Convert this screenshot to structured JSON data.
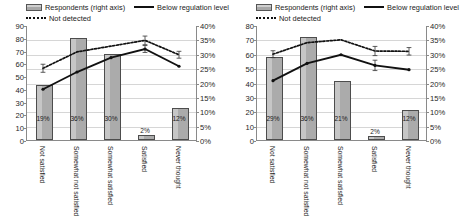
{
  "legend": {
    "bars_label": "Respondents (right axis)",
    "solid_label": "Below regulation level",
    "dotted_label": "Not detected"
  },
  "categories": [
    "Not satisfied",
    "Somewhat not satisfied",
    "Somewhat satisfied",
    "Satisfied",
    "Never thought"
  ],
  "chart_data": [
    {
      "type": "bar",
      "panel": "left",
      "title": "",
      "xlabel": "",
      "ylabel": "",
      "grid": true,
      "legend_position": "top",
      "categories": [
        "Not satisfied",
        "Somewhat not satisfied",
        "Somewhat satisfied",
        "Satisfied",
        "Never thought"
      ],
      "left_axis": {
        "ylim": [
          0,
          90
        ],
        "ticks": [
          "0",
          "10",
          "20",
          "30",
          "40",
          "50",
          "60",
          "70",
          "80",
          "90"
        ],
        "tick_values": [
          0,
          10,
          20,
          30,
          40,
          50,
          60,
          70,
          80,
          90
        ]
      },
      "right_axis": {
        "ylim": [
          0,
          40
        ],
        "ticks": [
          "0%",
          "5%",
          "10%",
          "15%",
          "20%",
          "25%",
          "30%",
          "35%",
          "40%"
        ],
        "tick_values": [
          0,
          5,
          10,
          15,
          20,
          25,
          30,
          35,
          40
        ]
      },
      "series": [
        {
          "name": "Respondents (right axis)",
          "kind": "bar",
          "axis": "left",
          "values": [
            43,
            80,
            67,
            4,
            25
          ],
          "data_labels": [
            "19%",
            "36%",
            "30%",
            "2%",
            "12%"
          ]
        },
        {
          "name": "Below regulation level",
          "kind": "line-solid",
          "axis": "right",
          "values": [
            18.0,
            24.0,
            29.0,
            32.0,
            26.0
          ],
          "errors": [
            0,
            0,
            0,
            1.2,
            0
          ]
        },
        {
          "name": "Not detected",
          "kind": "line-dotted",
          "axis": "right",
          "values": [
            25.3,
            31.0,
            33.0,
            35.0,
            30.0
          ],
          "errors": [
            1.4,
            0,
            0,
            1.5,
            1.2
          ]
        }
      ]
    },
    {
      "type": "bar",
      "panel": "right",
      "title": "",
      "xlabel": "",
      "ylabel": "",
      "grid": true,
      "legend_position": "top",
      "categories": [
        "Not satisfied",
        "Somewhat not satisfied",
        "Somewhat satisfied",
        "Satisfied",
        "Never thought"
      ],
      "left_axis": {
        "ylim": [
          0,
          80
        ],
        "ticks": [
          "0",
          "10",
          "20",
          "30",
          "40",
          "50",
          "60",
          "70",
          "80"
        ],
        "tick_values": [
          0,
          10,
          20,
          30,
          40,
          50,
          60,
          70,
          80
        ]
      },
      "right_axis": {
        "ylim": [
          0,
          40
        ],
        "ticks": [
          "0%",
          "5%",
          "10%",
          "15%",
          "20%",
          "25%",
          "30%",
          "35%",
          "40%"
        ],
        "tick_values": [
          0,
          5,
          10,
          15,
          20,
          25,
          30,
          35,
          40
        ]
      },
      "series": [
        {
          "name": "Respondents (right axis)",
          "kind": "bar",
          "axis": "left",
          "values": [
            58,
            72,
            41,
            3,
            21
          ],
          "data_labels": [
            "29%",
            "36%",
            "21%",
            "2%",
            "12%"
          ]
        },
        {
          "name": "Below regulation level",
          "kind": "line-solid",
          "axis": "right",
          "values": [
            21.0,
            27.0,
            30.0,
            26.3,
            24.8
          ],
          "errors": [
            0,
            0,
            0,
            1.8,
            0
          ]
        },
        {
          "name": "Not detected",
          "kind": "line-dotted",
          "axis": "right",
          "values": [
            30.2,
            34.2,
            35.2,
            31.3,
            31.2
          ],
          "errors": [
            1.2,
            0,
            0,
            1.6,
            1.3
          ]
        }
      ]
    }
  ]
}
